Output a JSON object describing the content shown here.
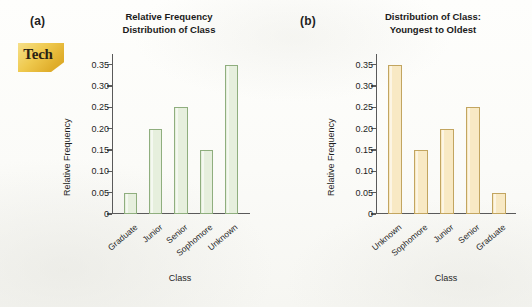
{
  "figure": {
    "background_color": "#fdfdfb",
    "badge": {
      "label": "Tech",
      "color": "#efc94e"
    }
  },
  "panels": [
    {
      "letter": "(a)",
      "title_line1": "Relative Frequency",
      "title_line2": "Distribution of Class",
      "ylabel": "Relative Frequency",
      "xlabel": "Class",
      "bar_color": "#e6efdd",
      "bar_edge_color": "#8fae7e"
    },
    {
      "letter": "(b)",
      "title_line1": "Distribution of Class:",
      "title_line2": "Youngest to Oldest",
      "ylabel": "Relative Frequency",
      "xlabel": "Class",
      "bar_color": "#f8e9c4",
      "bar_edge_color": "#c2a560"
    }
  ],
  "yticks": [
    "0",
    "0.05",
    "0.10",
    "0.15",
    "0.20",
    "0.25",
    "0.30",
    "0.35"
  ],
  "chart_data": [
    {
      "type": "bar",
      "title": "Relative Frequency Distribution of Class",
      "xlabel": "Class",
      "ylabel": "Relative Frequency",
      "categories": [
        "Graduate",
        "Junior",
        "Senior",
        "Sophomore",
        "Unknown"
      ],
      "values": [
        0.05,
        0.2,
        0.25,
        0.15,
        0.35
      ],
      "ylim": [
        0,
        0.375
      ],
      "yticks": [
        0,
        0.05,
        0.1,
        0.15,
        0.2,
        0.25,
        0.3,
        0.35
      ],
      "ytick_labels": [
        "0",
        "0.05",
        "0.10",
        "0.15",
        "0.20",
        "0.25",
        "0.30",
        "0.35"
      ],
      "grid": false,
      "legend": null,
      "bar_color": "#e6efdd",
      "bar_edge_color": "#8fae7e"
    },
    {
      "type": "bar",
      "title": "Distribution of Class: Youngest to Oldest",
      "xlabel": "Class",
      "ylabel": "Relative Frequency",
      "categories": [
        "Unknown",
        "Sophomore",
        "Junior",
        "Senior",
        "Graduate"
      ],
      "values": [
        0.35,
        0.15,
        0.2,
        0.25,
        0.05
      ],
      "ylim": [
        0,
        0.375
      ],
      "yticks": [
        0,
        0.05,
        0.1,
        0.15,
        0.2,
        0.25,
        0.3,
        0.35
      ],
      "ytick_labels": [
        "0",
        "0.05",
        "0.10",
        "0.15",
        "0.20",
        "0.25",
        "0.30",
        "0.35"
      ],
      "grid": false,
      "legend": null,
      "bar_color": "#f8e9c4",
      "bar_edge_color": "#c2a560"
    }
  ]
}
